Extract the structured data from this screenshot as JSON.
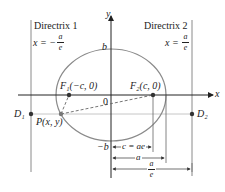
{
  "diagram": {
    "directrix1": {
      "title": "Directrix 1",
      "eq_lhs": "x = −",
      "frac_num": "a",
      "frac_den": "e"
    },
    "directrix2": {
      "title": "Directrix 2",
      "eq_lhs": "x =",
      "frac_num": "a",
      "frac_den": "e"
    },
    "axes": {
      "x_label": "x",
      "y_label": "y",
      "origin_label": "0"
    },
    "vertices": {
      "b": "b",
      "neg_b": "−b"
    },
    "foci": {
      "f1": "F₁(−c, 0)",
      "f2": "F₂(c, 0)"
    },
    "points": {
      "p": "P(x, y)",
      "d1": "D₁",
      "d2": "D₂"
    },
    "dimensions": {
      "c_eq": "c = ae",
      "a": "a",
      "a_over_e_num": "a",
      "a_over_e_den": "e"
    },
    "colors": {
      "curve": "#8a8a8a",
      "axis": "#222222",
      "point": "#333333",
      "guide": "#b0b0b0"
    }
  }
}
